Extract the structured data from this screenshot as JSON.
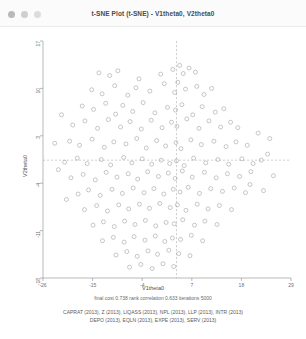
{
  "window": {
    "title": "t-SNE Plot (t-SNE) - V1theta0, V2theta0",
    "controls": [
      {
        "name": "close-button",
        "color": "#b9b9b9"
      },
      {
        "name": "minimize-button",
        "color": "#cfcfcf"
      },
      {
        "name": "zoom-button",
        "color": "#dcdcdc"
      }
    ]
  },
  "stats": {
    "line": "final cost  0.738   rank correlation  0.633   iterations  5000"
  },
  "footnote": {
    "line1": "CAPRAT (2013), Z (2013), LIQASS (2013), NPL (2013), LLP (2013), INTR (2013)",
    "line2": "DEPO (2013), EQLN (2013), EXPE (2013), SERV (2013)"
  },
  "chart_data": {
    "type": "scatter",
    "title": "t-SNE Plot (t-SNE) - V1theta0, V2theta0",
    "xlabel": "V1theta0",
    "ylabel": "V2theta0",
    "xlim": [
      -26,
      29
    ],
    "ylim": [
      -18,
      17
    ],
    "xticks": [
      -26,
      -15,
      -4,
      7,
      18,
      29
    ],
    "yticks": [
      17,
      10,
      3,
      -4,
      -11,
      -18
    ],
    "grid": false,
    "legend": "none",
    "marker": {
      "shape": "circle-open",
      "color": "#9a9a9a",
      "size": 2
    },
    "reference_lines": [
      {
        "axis": "vertical",
        "value": 3.6,
        "style": "dashed",
        "color": "#a0a0a0"
      },
      {
        "axis": "horizontal",
        "value": -0.6,
        "style": "dashed",
        "color": "#a0a0a0"
      }
    ],
    "points": [
      [
        -13.6,
        12.3
      ],
      [
        -11.2,
        11.9
      ],
      [
        -9.4,
        12.6
      ],
      [
        -4.7,
        11.4
      ],
      [
        0.1,
        12.1
      ],
      [
        2.8,
        12.8
      ],
      [
        4.3,
        13.4
      ],
      [
        5.1,
        12.2
      ],
      [
        6.4,
        13.0
      ],
      [
        7.8,
        12.4
      ],
      [
        -15.2,
        9.8
      ],
      [
        -12.9,
        9.2
      ],
      [
        -10.1,
        10.4
      ],
      [
        -7.2,
        9.0
      ],
      [
        -5.4,
        10.1
      ],
      [
        -2.3,
        9.6
      ],
      [
        0.9,
        10.7
      ],
      [
        3.2,
        9.4
      ],
      [
        3.9,
        10.9
      ],
      [
        5.6,
        9.9
      ],
      [
        8.1,
        10.3
      ],
      [
        9.7,
        9.1
      ],
      [
        11.4,
        10.0
      ],
      [
        -17.3,
        7.4
      ],
      [
        -14.8,
        6.9
      ],
      [
        -12.1,
        7.8
      ],
      [
        -9.9,
        6.2
      ],
      [
        -8.3,
        7.5
      ],
      [
        -6.1,
        6.6
      ],
      [
        -3.8,
        7.9
      ],
      [
        -1.2,
        6.4
      ],
      [
        1.6,
        7.2
      ],
      [
        3.4,
        6.8
      ],
      [
        4.8,
        7.6
      ],
      [
        7.2,
        6.1
      ],
      [
        9.3,
        7.3
      ],
      [
        12.2,
        6.5
      ],
      [
        14.1,
        7.0
      ],
      [
        -19.4,
        4.6
      ],
      [
        -16.7,
        5.2
      ],
      [
        -13.9,
        4.1
      ],
      [
        -11.5,
        5.4
      ],
      [
        -8.8,
        4.3
      ],
      [
        -6.7,
        5.1
      ],
      [
        -4.2,
        4.0
      ],
      [
        -2.0,
        5.3
      ],
      [
        0.4,
        4.2
      ],
      [
        2.5,
        5.0
      ],
      [
        3.7,
        4.4
      ],
      [
        5.9,
        5.5
      ],
      [
        8.6,
        4.1
      ],
      [
        10.8,
        5.2
      ],
      [
        13.4,
        4.3
      ],
      [
        15.6,
        5.0
      ],
      [
        17.2,
        4.2
      ],
      [
        -20.1,
        2.2
      ],
      [
        -17.9,
        1.6
      ],
      [
        -15.1,
        2.5
      ],
      [
        -12.4,
        1.3
      ],
      [
        -10.3,
        2.1
      ],
      [
        -7.6,
        1.8
      ],
      [
        -5.2,
        2.6
      ],
      [
        -3.1,
        1.2
      ],
      [
        -0.8,
        2.3
      ],
      [
        1.2,
        1.5
      ],
      [
        3.5,
        2.0
      ],
      [
        4.6,
        1.1
      ],
      [
        6.8,
        2.4
      ],
      [
        9.1,
        1.7
      ],
      [
        11.9,
        2.2
      ],
      [
        14.6,
        1.4
      ],
      [
        16.8,
        2.1
      ],
      [
        19.3,
        1.6
      ],
      [
        -21.2,
        -0.9
      ],
      [
        -18.4,
        -0.3
      ],
      [
        -16.2,
        -1.1
      ],
      [
        -13.1,
        -0.5
      ],
      [
        -11.0,
        -1.3
      ],
      [
        -8.1,
        -0.2
      ],
      [
        -6.3,
        -1.0
      ],
      [
        -4.0,
        -0.4
      ],
      [
        -1.9,
        -1.2
      ],
      [
        0.2,
        -0.6
      ],
      [
        2.1,
        -1.1
      ],
      [
        3.6,
        -0.7
      ],
      [
        5.3,
        -1.4
      ],
      [
        7.4,
        -0.3
      ],
      [
        10.1,
        -1.0
      ],
      [
        12.8,
        -0.5
      ],
      [
        15.2,
        -1.2
      ],
      [
        18.1,
        -0.4
      ],
      [
        20.6,
        -1.1
      ],
      [
        22.4,
        -0.6
      ],
      [
        -19.8,
        -3.2
      ],
      [
        -17.1,
        -2.7
      ],
      [
        -14.4,
        -3.5
      ],
      [
        -12.0,
        -2.4
      ],
      [
        -9.6,
        -3.1
      ],
      [
        -7.1,
        -2.6
      ],
      [
        -5.0,
        -3.4
      ],
      [
        -2.8,
        -2.3
      ],
      [
        -0.4,
        -3.0
      ],
      [
        1.8,
        -2.5
      ],
      [
        3.3,
        -3.3
      ],
      [
        4.9,
        -2.2
      ],
      [
        7.1,
        -3.1
      ],
      [
        9.8,
        -2.4
      ],
      [
        12.4,
        -3.2
      ],
      [
        14.9,
        -2.6
      ],
      [
        17.6,
        -3.0
      ],
      [
        20.1,
        -2.3
      ],
      [
        -18.2,
        -5.6
      ],
      [
        -15.9,
        -5.0
      ],
      [
        -13.3,
        -5.8
      ],
      [
        -10.7,
        -4.9
      ],
      [
        -8.4,
        -5.5
      ],
      [
        -6.0,
        -4.7
      ],
      [
        -3.6,
        -5.4
      ],
      [
        -1.4,
        -4.8
      ],
      [
        0.8,
        -5.6
      ],
      [
        2.9,
        -4.9
      ],
      [
        4.4,
        -5.3
      ],
      [
        6.2,
        -4.6
      ],
      [
        8.7,
        -5.5
      ],
      [
        11.2,
        -4.8
      ],
      [
        13.8,
        -5.2
      ],
      [
        16.4,
        -4.7
      ],
      [
        18.9,
        -5.4
      ],
      [
        -16.8,
        -7.9
      ],
      [
        -14.1,
        -7.3
      ],
      [
        -11.7,
        -8.1
      ],
      [
        -9.2,
        -7.2
      ],
      [
        -7.0,
        -7.8
      ],
      [
        -4.6,
        -7.1
      ],
      [
        -2.4,
        -7.7
      ],
      [
        -0.1,
        -7.0
      ],
      [
        2.2,
        -7.6
      ],
      [
        3.8,
        -7.2
      ],
      [
        5.7,
        -8.0
      ],
      [
        8.2,
        -7.1
      ],
      [
        10.6,
        -7.8
      ],
      [
        13.1,
        -7.3
      ],
      [
        15.8,
        -7.9
      ],
      [
        -14.9,
        -10.2
      ],
      [
        -12.6,
        -9.7
      ],
      [
        -10.2,
        -10.4
      ],
      [
        -7.9,
        -9.6
      ],
      [
        -5.6,
        -10.1
      ],
      [
        -3.3,
        -9.5
      ],
      [
        -1.0,
        -10.3
      ],
      [
        1.3,
        -9.8
      ],
      [
        3.1,
        -10.0
      ],
      [
        5.0,
        -9.4
      ],
      [
        7.6,
        -10.2
      ],
      [
        9.9,
        -9.6
      ],
      [
        12.6,
        -10.1
      ],
      [
        -12.8,
        -12.5
      ],
      [
        -10.4,
        -12.0
      ],
      [
        -8.0,
        -12.7
      ],
      [
        -5.8,
        -11.9
      ],
      [
        -3.4,
        -12.4
      ],
      [
        -1.1,
        -11.8
      ],
      [
        1.0,
        -12.6
      ],
      [
        2.7,
        -12.1
      ],
      [
        4.5,
        -12.3
      ],
      [
        6.9,
        -11.7
      ],
      [
        9.4,
        -12.5
      ],
      [
        -9.8,
        -14.6
      ],
      [
        -7.4,
        -14.1
      ],
      [
        -5.1,
        -14.8
      ],
      [
        -2.7,
        -14.0
      ],
      [
        -0.6,
        -14.5
      ],
      [
        1.9,
        -13.9
      ],
      [
        4.1,
        -14.4
      ],
      [
        6.6,
        -14.7
      ],
      [
        -6.8,
        -16.4
      ],
      [
        -4.3,
        -16.0
      ],
      [
        -1.8,
        -16.6
      ],
      [
        0.6,
        -15.9
      ],
      [
        3.0,
        -16.3
      ],
      [
        -21.9,
        6.1
      ],
      [
        -22.6,
        -2.0
      ],
      [
        -20.8,
        -6.4
      ],
      [
        23.8,
        0.3
      ],
      [
        25.1,
        -2.9
      ],
      [
        21.7,
        3.4
      ],
      [
        19.9,
        -4.2
      ],
      [
        -23.4,
        1.9
      ],
      [
        22.9,
        -5.1
      ],
      [
        24.3,
        2.6
      ]
    ]
  }
}
